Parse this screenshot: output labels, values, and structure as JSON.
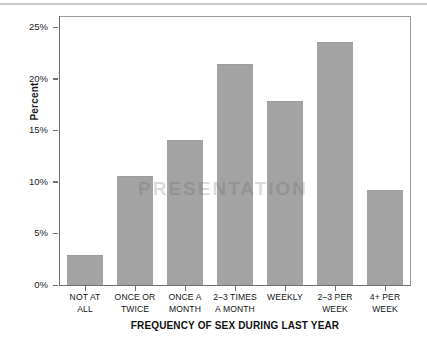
{
  "chart_data": {
    "type": "bar",
    "title": "",
    "xlabel": "FREQUENCY OF SEX DURING LAST YEAR",
    "ylabel": "Percent",
    "categories": [
      "NOT AT\nALL",
      "ONCE OR\nTWICE",
      "ONCE A\nMONTH",
      "2–3 TIMES\nA MONTH",
      "WEEKLY",
      "2–3 PER\nWEEK",
      "4+ PER\nWEEK"
    ],
    "values": [
      2.9,
      10.6,
      14.1,
      21.4,
      17.9,
      23.6,
      9.2
    ],
    "ylim": [
      0,
      26
    ],
    "yticks": [
      0,
      5,
      10,
      15,
      20,
      25
    ],
    "ytick_labels": [
      "0%",
      "5%",
      "10%",
      "15%",
      "20%",
      "25%"
    ],
    "grid": false,
    "legend": "none",
    "bar_color": "#a3a3a3",
    "axis_color": "#6f6f6f",
    "text_color": "#151515"
  },
  "watermark": {
    "text": "PRESENTATION"
  }
}
